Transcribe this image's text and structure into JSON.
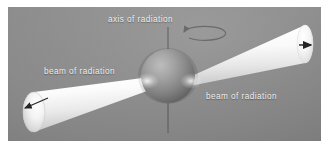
{
  "figure": {
    "background_color": "#ffffff",
    "panel_color": "#898989"
  },
  "labels": {
    "axis": "axis of radiation",
    "beam_left": "beam of radiation",
    "beam_right": "beam of radiation"
  },
  "elements": {
    "sphere": {
      "name": "neutron-star-sphere",
      "center_x": 168,
      "center_y": 76,
      "radius": 27,
      "color": "#8a8a8a",
      "highlight_color": "#b4b4b4",
      "shadow_color": "#585858"
    },
    "axis_line": {
      "name": "rotation-axis-line",
      "x": 168,
      "y_top": 27,
      "y_bottom": 133,
      "color": "#6d6d6d"
    },
    "rotation_arrow": {
      "name": "rotation-direction-arrow",
      "center_x": 168,
      "center_y": 38,
      "rx": 21,
      "ry": 7,
      "color": "#6b6b6b"
    },
    "beam_left": {
      "name": "beam-cone-left",
      "apex_x": 158,
      "apex_y": 76,
      "base_center_x": 34,
      "base_center_y": 112,
      "base_rx": 11,
      "base_ry": 20,
      "color": "#fdfdfd"
    },
    "beam_right": {
      "name": "beam-cone-right",
      "apex_x": 185,
      "apex_y": 78,
      "base_center_x": 305,
      "base_center_y": 44,
      "base_rx": 8,
      "base_ry": 19,
      "color": "#fdfdfd"
    },
    "radius_arrow_left": {
      "name": "beam-radius-arrow-left",
      "from_x": 48,
      "from_y": 98,
      "to_x": 24,
      "to_y": 108,
      "color": "#2b2b2b"
    },
    "radius_arrow_right": {
      "name": "beam-direction-arrow-right",
      "from_x": 296,
      "from_y": 46,
      "to_x": 308,
      "to_y": 46,
      "color": "#1f1f1f"
    }
  }
}
